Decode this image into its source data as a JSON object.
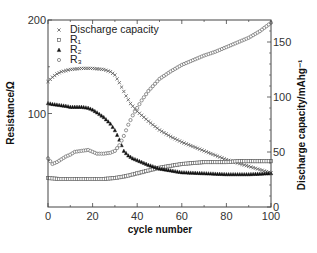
{
  "chart_data": {
    "type": "scatter",
    "title": "",
    "xlabel": "cycle number",
    "ylabel": "Resistance/Ω",
    "ylabel_right": "Discharge capacity/mAhg⁻¹",
    "xlim": [
      0,
      100
    ],
    "ylim": [
      0,
      200
    ],
    "ylim_right": [
      0,
      170
    ],
    "x_ticks": [
      0,
      20,
      40,
      60,
      80,
      100
    ],
    "y_ticks": [
      100,
      200
    ],
    "y_ticks_right": [
      0,
      50,
      100,
      150
    ],
    "grid": false,
    "legend_position": "upper left",
    "series": [
      {
        "name": "Discharge capacity",
        "marker": "x",
        "axis": "right",
        "x": [
          0,
          2,
          4,
          6,
          8,
          10,
          15,
          20,
          25,
          28,
          30,
          32,
          35,
          37,
          40,
          45,
          50,
          55,
          60,
          65,
          70,
          75,
          80,
          85,
          90,
          95,
          100
        ],
        "values": [
          114,
          118,
          121,
          123,
          124,
          125,
          126,
          126,
          125,
          123,
          120,
          113,
          101,
          94,
          87,
          78,
          70,
          64,
          59,
          55,
          51,
          47,
          43,
          40,
          37,
          34,
          31
        ]
      },
      {
        "name": "R₁",
        "marker": "square",
        "axis": "left",
        "x": [
          0,
          5,
          10,
          15,
          20,
          25,
          30,
          35,
          40,
          45,
          50,
          55,
          60,
          65,
          70,
          75,
          80,
          85,
          90,
          95,
          100
        ],
        "values": [
          31,
          30,
          30,
          30,
          30,
          30,
          31,
          33,
          36,
          39,
          42,
          44,
          46,
          47,
          48,
          48,
          48,
          49,
          49,
          49,
          49
        ]
      },
      {
        "name": "R₂",
        "marker": "triangle",
        "axis": "left",
        "x": [
          0,
          2,
          5,
          8,
          10,
          12,
          15,
          18,
          20,
          22,
          25,
          28,
          30,
          32,
          34,
          36,
          38,
          40,
          45,
          50,
          55,
          60,
          70,
          80,
          90,
          100
        ],
        "values": [
          111,
          110,
          109,
          108,
          107,
          107,
          107,
          106,
          104,
          101,
          96,
          89,
          82,
          72,
          60,
          55,
          52,
          50,
          45,
          41,
          39,
          37,
          36,
          35,
          35,
          36
        ]
      },
      {
        "name": "R₃",
        "marker": "circle",
        "axis": "left",
        "x": [
          0,
          2,
          4,
          6,
          8,
          10,
          12,
          15,
          18,
          20,
          22,
          25,
          28,
          30,
          32,
          34,
          36,
          38,
          40,
          42,
          45,
          50,
          55,
          60,
          65,
          70,
          75,
          80,
          85,
          90,
          95,
          100
        ],
        "values": [
          52,
          46,
          48,
          51,
          54,
          56,
          59,
          60,
          61,
          59,
          57,
          57,
          58,
          60,
          66,
          76,
          88,
          98,
          106,
          114,
          124,
          137,
          145,
          152,
          157,
          162,
          166,
          171,
          176,
          181,
          188,
          197
        ]
      }
    ]
  }
}
